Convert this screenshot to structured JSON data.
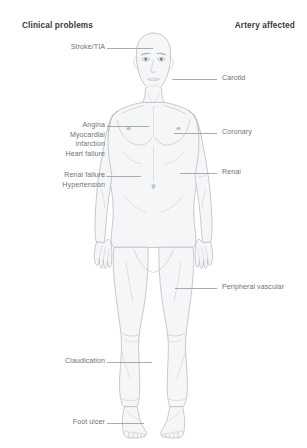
{
  "headers": {
    "left": "Clinical problems",
    "right": "Artery affected"
  },
  "colors": {
    "header_text": "#36393c",
    "label_text": "#6f7378",
    "leader_line": "#8e9296",
    "body_outline": "#b9bdc1",
    "body_fill": "#f5f6f7",
    "background": "#ffffff"
  },
  "clinical_problems": [
    {
      "id": "stroke-tia",
      "lines": [
        "Stroke/TIA"
      ],
      "label_x": 38,
      "label_y": 43,
      "leader": {
        "x1": 107,
        "y1": 48,
        "x2": 153,
        "y2": 48
      }
    },
    {
      "id": "angina-mi-heart-failure",
      "lines": [
        "Angina",
        "Myocardial",
        "infarction",
        "Heart failure"
      ],
      "label_x": 30,
      "label_y": 121,
      "leader": {
        "x1": 107,
        "y1": 126,
        "x2": 149,
        "y2": 126
      }
    },
    {
      "id": "renal-failure-hypertension",
      "lines": [
        "Renal failure",
        "Hypertension"
      ],
      "label_x": 30,
      "label_y": 171,
      "leader": {
        "x1": 107,
        "y1": 176,
        "x2": 141,
        "y2": 176
      }
    },
    {
      "id": "claudication",
      "lines": [
        "Claudication"
      ],
      "label_x": 32,
      "label_y": 357,
      "leader": {
        "x1": 107,
        "y1": 362,
        "x2": 152,
        "y2": 362
      }
    },
    {
      "id": "foot-ulcer",
      "lines": [
        "Foot ulcer"
      ],
      "label_x": 44,
      "label_y": 418,
      "leader": {
        "x1": 107,
        "y1": 423,
        "x2": 144,
        "y2": 423
      }
    }
  ],
  "arteries_affected": [
    {
      "id": "carotid",
      "lines": [
        "Carotid"
      ],
      "label_x": 222,
      "label_y": 74,
      "leader": {
        "x1": 172,
        "y1": 79,
        "x2": 217,
        "y2": 79
      }
    },
    {
      "id": "coronary",
      "lines": [
        "Coronary"
      ],
      "label_x": 222,
      "label_y": 128,
      "leader": {
        "x1": 174,
        "y1": 133,
        "x2": 217,
        "y2": 133
      }
    },
    {
      "id": "renal",
      "lines": [
        "Renal"
      ],
      "label_x": 222,
      "label_y": 168,
      "leader": {
        "x1": 180,
        "y1": 173,
        "x2": 217,
        "y2": 173
      }
    },
    {
      "id": "peripheral-vascular",
      "lines": [
        "Peripheral vascular"
      ],
      "label_x": 222,
      "label_y": 283,
      "leader": {
        "x1": 175,
        "y1": 288,
        "x2": 217,
        "y2": 288
      }
    }
  ]
}
